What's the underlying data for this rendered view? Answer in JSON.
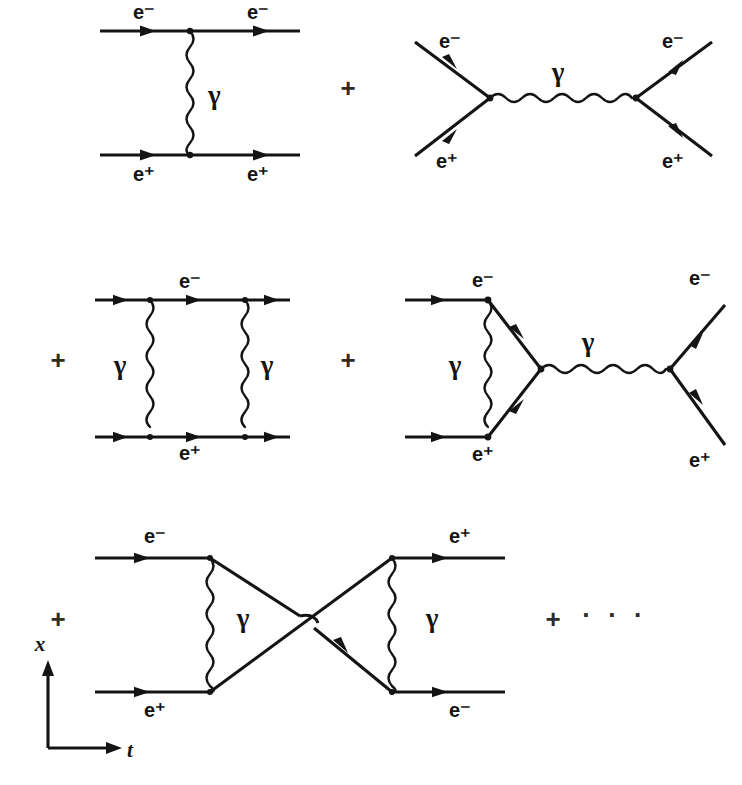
{
  "figure": {
    "background_color": "#ffffff",
    "ink_color": "#141414",
    "width": 742,
    "height": 785
  },
  "particles": {
    "electron": "e⁻",
    "positron": "e⁺",
    "photon": "γ"
  },
  "operators": {
    "plus": "+",
    "ellipsis": "· · ·"
  },
  "axes": {
    "vertical_label": "x",
    "horizontal_label": "t"
  },
  "rows": [
    {
      "id": "row-1",
      "diagrams": [
        {
          "id": "t-channel-tree",
          "name": "t-channel one-photon exchange",
          "labels": [
            {
              "text": "e⁻",
              "x": 144,
              "y": 14
            },
            {
              "text": "e⁻",
              "x": 258,
              "y": 14
            },
            {
              "text": "γ",
              "x": 208,
              "y": 98
            },
            {
              "text": "e⁺",
              "x": 144,
              "y": 176
            },
            {
              "text": "e⁺",
              "x": 258,
              "y": 176
            }
          ]
        },
        {
          "id": "s-channel-tree",
          "name": "s-channel annihilation",
          "labels": [
            {
              "text": "e⁻",
              "x": 450,
              "y": 43
            },
            {
              "text": "e⁻",
              "x": 673,
              "y": 43
            },
            {
              "text": "γ",
              "x": 558,
              "y": 75
            },
            {
              "text": "e⁺",
              "x": 447,
              "y": 163
            },
            {
              "text": "e⁺",
              "x": 673,
              "y": 163
            }
          ]
        }
      ],
      "operators": [
        {
          "text": "+",
          "x": 348,
          "y": 90
        }
      ]
    },
    {
      "id": "row-2",
      "diagrams": [
        {
          "id": "box-diagram",
          "name": "two-photon box correction",
          "labels": [
            {
              "text": "e⁻",
              "x": 190,
              "y": 283
            },
            {
              "text": "γ",
              "x": 120,
              "y": 368
            },
            {
              "text": "γ",
              "x": 267,
              "y": 368
            },
            {
              "text": "e⁺",
              "x": 190,
              "y": 455
            }
          ]
        },
        {
          "id": "vertex-correction-annihilation",
          "name": "vertex correction with s-channel annihilation",
          "labels": [
            {
              "text": "e⁻",
              "x": 483,
              "y": 282
            },
            {
              "text": "γ",
              "x": 455,
              "y": 368
            },
            {
              "text": "γ",
              "x": 588,
              "y": 345
            },
            {
              "text": "e⁺",
              "x": 483,
              "y": 456
            },
            {
              "text": "e⁻",
              "x": 700,
              "y": 280
            },
            {
              "text": "e⁺",
              "x": 700,
              "y": 462
            }
          ]
        }
      ],
      "operators": [
        {
          "text": "+",
          "x": 58,
          "y": 362
        },
        {
          "text": "+",
          "x": 348,
          "y": 362
        }
      ]
    },
    {
      "id": "row-3",
      "diagrams": [
        {
          "id": "crossed-box",
          "name": "crossed two-photon exchange",
          "labels": [
            {
              "text": "e⁻",
              "x": 155,
              "y": 538
            },
            {
              "text": "γ",
              "x": 243,
              "y": 621
            },
            {
              "text": "e⁺",
              "x": 155,
              "y": 712
            },
            {
              "text": "e⁺",
              "x": 460,
              "y": 538
            },
            {
              "text": "γ",
              "x": 432,
              "y": 621
            },
            {
              "text": "e⁻",
              "x": 460,
              "y": 712
            }
          ]
        }
      ],
      "operators": [
        {
          "text": "+",
          "x": 58,
          "y": 621
        },
        {
          "text": "+",
          "x": 553,
          "y": 621
        },
        {
          "text": "· · ·",
          "x": 615,
          "y": 617
        }
      ]
    }
  ],
  "geometry": {
    "d1": {
      "top_line": {
        "x1": 100,
        "x2": 300,
        "y": 31
      },
      "bottom_line": {
        "x1": 100,
        "x2": 300,
        "y": 155
      },
      "photon": {
        "x": 190,
        "y1": 31,
        "y2": 155
      },
      "vertices": [
        [
          190,
          31
        ],
        [
          190,
          155
        ]
      ],
      "arrows": [
        [
          150,
          31
        ],
        [
          263,
          31
        ],
        [
          150,
          155
        ],
        [
          263,
          155
        ]
      ]
    },
    "d2": {
      "left_vertex": [
        490,
        98
      ],
      "right_vertex": [
        636,
        98
      ],
      "in_electron": [
        415,
        42
      ],
      "in_positron": [
        415,
        156
      ],
      "out_electron": [
        712,
        42
      ],
      "out_positron": [
        712,
        156
      ]
    },
    "d3": {
      "top_line": {
        "x1": 95,
        "x2": 290,
        "y": 300
      },
      "bottom_line": {
        "x1": 95,
        "x2": 290,
        "y": 437
      },
      "photon_left_x": 150,
      "photon_right_x": 245
    },
    "d4": {
      "top_in": {
        "x1": 405,
        "x2": 488,
        "y": 300
      },
      "bottom_in": {
        "x1": 405,
        "x2": 488,
        "y": 437
      },
      "loop_apex": [
        541,
        369
      ],
      "photon_vertical_x": 488,
      "s_photon": {
        "x1": 541,
        "x2": 670,
        "y": 369
      },
      "out_electron": [
        725,
        305
      ],
      "out_positron": [
        725,
        445
      ]
    },
    "d5": {
      "top_in": {
        "x1": 95,
        "x2": 210,
        "y": 558
      },
      "bottom_in": {
        "x1": 95,
        "x2": 210,
        "y": 692
      },
      "cross_point": [
        307,
        622
      ],
      "right_top": [
        392,
        558
      ],
      "right_bottom": [
        392,
        692
      ],
      "top_out": {
        "x1": 392,
        "x2": 505,
        "y": 558
      },
      "bottom_out": {
        "x1": 392,
        "x2": 505,
        "y": 692
      },
      "photon_left_x": 210,
      "photon_right_x": 392
    },
    "axes": {
      "corner": [
        48,
        748
      ],
      "vertical_top": [
        48,
        668
      ],
      "horizontal_right": [
        115,
        748
      ],
      "x_label": [
        44,
        646
      ],
      "t_label": [
        127,
        751
      ]
    }
  }
}
